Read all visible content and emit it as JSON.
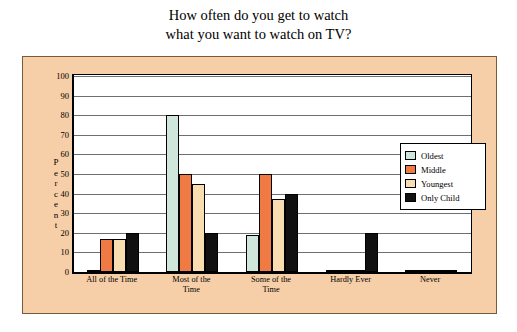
{
  "chart_data": {
    "type": "bar",
    "title_lines": [
      "How often do you get to watch",
      "what you want to watch on TV?"
    ],
    "title": "How often do you get to watch what you want to watch on TV?",
    "xlabel": "",
    "ylabel": "Percent",
    "ylabel_letters": [
      "P",
      "e",
      "r",
      "c",
      "e",
      "n",
      "t"
    ],
    "ylim": [
      0,
      100
    ],
    "yticks": [
      0,
      10,
      20,
      30,
      40,
      50,
      60,
      70,
      80,
      90,
      100
    ],
    "ytick_labels": [
      "0",
      "10",
      "20",
      "30",
      "40",
      "50",
      "60",
      "70",
      "80",
      "90",
      "100"
    ],
    "grid": true,
    "legend_position": "right",
    "categories": [
      "All of the Time",
      "Most of the Time",
      "Some of the Time",
      "Hardly Ever",
      "Never"
    ],
    "category_lines": [
      [
        "All of the Time"
      ],
      [
        "Most of the",
        "Time"
      ],
      [
        "Some of the",
        "Time"
      ],
      [
        "Hardly Ever"
      ],
      [
        "Never"
      ]
    ],
    "series": [
      {
        "name": "Oldest",
        "color": "#cfe6dc",
        "values": [
          0,
          80,
          19,
          0,
          0
        ]
      },
      {
        "name": "Middle",
        "color": "#f07a43",
        "values": [
          17,
          50,
          50,
          0,
          1
        ]
      },
      {
        "name": "Youngest",
        "color": "#f7ddb0",
        "values": [
          17,
          45,
          37,
          0,
          1
        ]
      },
      {
        "name": "Only Child",
        "color": "#101010",
        "values": [
          20,
          20,
          40,
          20,
          1
        ]
      }
    ]
  },
  "colors": {
    "panel_background": "#f6cfa8",
    "panel_border": "#7a5a3a",
    "plot_background": "#ffffff",
    "gridline": "#6f6f6f",
    "axis": "#000000"
  }
}
